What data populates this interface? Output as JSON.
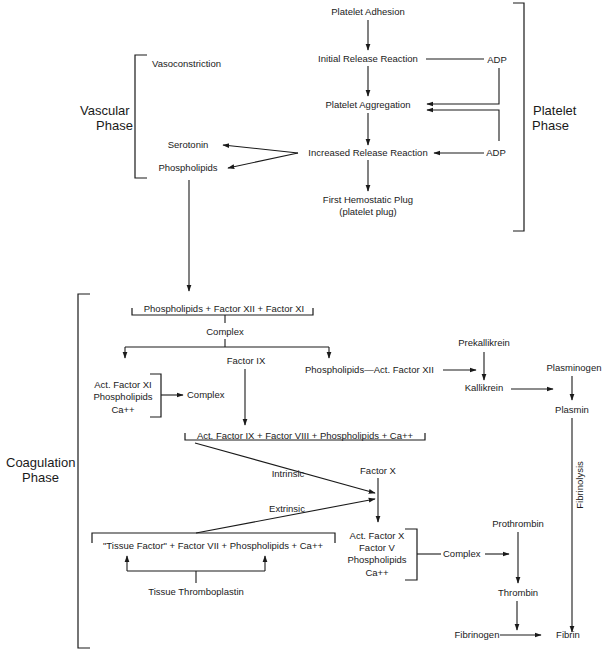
{
  "phases": {
    "vascular": [
      "Vascular",
      "Phase"
    ],
    "platelet": [
      "Platelet",
      "Phase"
    ],
    "coagulation": [
      "Coagulation",
      "Phase"
    ]
  },
  "platelet": {
    "adhesion": "Platelet Adhesion",
    "initial_release": "Initial Release Reaction",
    "adp_1": "ADP",
    "aggregation": "Platelet Aggregation",
    "increased_release": "Increased Release Reaction",
    "adp_2": "ADP",
    "plug_line1": "First Hemostatic Plug",
    "plug_line2": "(platelet plug)"
  },
  "vascular": {
    "vasoconstriction": "Vasoconstriction",
    "serotonin": "Serotonin",
    "phospholipids": "Phospholipids"
  },
  "coagulation": {
    "contact_group": "Phospholipids + Factor XII + Factor XI",
    "complex_1": "Complex",
    "factor_ix": "Factor IX",
    "act_xi_group": [
      "Act. Factor XI",
      "Phospholipids",
      "Ca++"
    ],
    "complex_2": "Complex",
    "phospholipids_act_xii": "Phospholipids—Act. Factor XII",
    "prekallikrein": "Prekallikrein",
    "kallikrein": "Kallikrein",
    "plasminogen": "Plasminogen",
    "plasmin": "Plasmin",
    "fibrinolysis": "Fibrinolysis",
    "ix_group": "Act. Factor IX + Factor VIII + Phospholipids + Ca++",
    "intrinsic": "Intrinsic",
    "extrinsic": "Extrinsic",
    "factor_x": "Factor X",
    "tissue_group": "\"Tissue Factor\" + Factor VII + Phospholipids + Ca++",
    "tissue_thromboplastin": "Tissue Thromboplastin",
    "x_group": [
      "Act. Factor X",
      "Factor V",
      "Phospholipids",
      "Ca++"
    ],
    "complex_3": "Complex",
    "prothrombin": "Prothrombin",
    "thrombin": "Thrombin",
    "fibrinogen": "Fibrinogen",
    "fibrin": "Fibrin"
  }
}
